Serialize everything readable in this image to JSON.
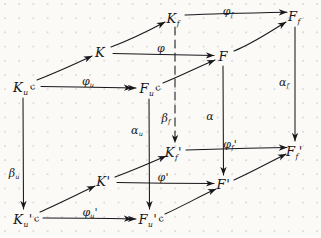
{
  "figure": {
    "kind": "commutative-diagram",
    "ink_color": "#17171c",
    "paper_color": "#fbfaf6",
    "grid_dot_color": "#969baa"
  },
  "nodes": [
    {
      "id": "Kf",
      "base": "K",
      "sub": "f",
      "prime": "",
      "hook": "",
      "x": 174,
      "y": 18
    },
    {
      "id": "Ff",
      "base": "F",
      "sub": "f",
      "prime": "",
      "hook": "",
      "x": 295,
      "y": 16
    },
    {
      "id": "K",
      "base": "K",
      "sub": "",
      "prime": "",
      "hook": "",
      "x": 101,
      "y": 52
    },
    {
      "id": "F",
      "base": "F",
      "sub": "",
      "prime": "",
      "hook": "",
      "x": 224,
      "y": 56
    },
    {
      "id": "Ku",
      "base": "K",
      "sub": "u",
      "prime": "",
      "hook": "c",
      "x": 24,
      "y": 87
    },
    {
      "id": "Fu",
      "base": "F",
      "sub": "u",
      "prime": "",
      "hook": "c",
      "x": 150,
      "y": 88
    },
    {
      "id": "Kfp",
      "base": "K",
      "sub": "f",
      "prime": "'",
      "hook": "",
      "x": 174,
      "y": 152
    },
    {
      "id": "Ffp",
      "base": "F",
      "sub": "f",
      "prime": "'",
      "hook": "",
      "x": 295,
      "y": 151
    },
    {
      "id": "Kp",
      "base": "K",
      "sub": "",
      "prime": "'",
      "hook": "",
      "x": 104,
      "y": 181
    },
    {
      "id": "Fp",
      "base": "F",
      "sub": "",
      "prime": "'",
      "hook": "",
      "x": 224,
      "y": 184
    },
    {
      "id": "Kup",
      "base": "K",
      "sub": "u",
      "prime": "'",
      "hook": "c",
      "x": 26,
      "y": 219
    },
    {
      "id": "Fup",
      "base": "F",
      "sub": "u",
      "prime": "'",
      "hook": "c",
      "x": 151,
      "y": 219
    }
  ],
  "arrow_labels": [
    {
      "id": "phi_f",
      "base": "φ",
      "sub": "f",
      "prime": "",
      "x": 228,
      "y": 10,
      "of": "Kf-to-Ff"
    },
    {
      "id": "phi",
      "base": "φ",
      "sub": "",
      "prime": "",
      "x": 161,
      "y": 47,
      "of": "K-to-F"
    },
    {
      "id": "phi_u",
      "base": "φ",
      "sub": "u",
      "prime": "",
      "x": 88,
      "y": 80,
      "of": "Ku-to-Fu"
    },
    {
      "id": "alpha_f",
      "base": "α",
      "sub": "f",
      "prime": "",
      "x": 284,
      "y": 81,
      "of": "Ff-to-Ffp"
    },
    {
      "id": "beta_f",
      "base": "β",
      "sub": "f",
      "prime": "",
      "x": 166,
      "y": 117,
      "of": "Kf-to-Kfp"
    },
    {
      "id": "alpha",
      "base": "α",
      "sub": "",
      "prime": "",
      "x": 210,
      "y": 115,
      "of": "F-to-Fp"
    },
    {
      "id": "alpha_u",
      "base": "α",
      "sub": "u",
      "prime": "",
      "x": 137,
      "y": 129,
      "of": "Fu-to-Fup"
    },
    {
      "id": "phi_f_p",
      "base": "φ",
      "sub": "f",
      "prime": "'",
      "x": 230,
      "y": 143,
      "of": "Kfp-to-Ffp"
    },
    {
      "id": "beta_u",
      "base": "β",
      "sub": "u",
      "prime": "",
      "x": 14,
      "y": 172,
      "of": "Ku-to-Kup"
    },
    {
      "id": "phi_p",
      "base": "φ",
      "sub": "",
      "prime": "'",
      "x": 163,
      "y": 176,
      "of": "Kp-to-Fp"
    },
    {
      "id": "phi_u_p",
      "base": "φ",
      "sub": "u",
      "prime": "'",
      "x": 90,
      "y": 211,
      "of": "Kup-to-Fup"
    }
  ],
  "edges": [
    {
      "id": "Kf-to-Ff",
      "style": "solid",
      "head": "single",
      "from": "Kf",
      "to": "Ff"
    },
    {
      "id": "K-to-F",
      "style": "solid",
      "head": "single",
      "from": "K",
      "to": "F"
    },
    {
      "id": "Ku-to-Fu",
      "style": "solid",
      "head": "double",
      "from": "Ku",
      "to": "Fu"
    },
    {
      "id": "Ku-to-K",
      "style": "solid",
      "head": "single",
      "from": "Ku",
      "to": "K"
    },
    {
      "id": "K-to-Kf",
      "style": "solid",
      "head": "single",
      "from": "K",
      "to": "Kf"
    },
    {
      "id": "Fu-to-F",
      "style": "solid",
      "head": "single",
      "from": "Fu",
      "to": "F"
    },
    {
      "id": "F-to-Ff",
      "style": "solid",
      "head": "single",
      "from": "F",
      "to": "Ff"
    },
    {
      "id": "Kf-to-Kfp",
      "style": "dashed",
      "head": "single",
      "from": "Kf",
      "to": "Kfp"
    },
    {
      "id": "F-to-Fp",
      "style": "solid",
      "head": "single",
      "from": "F",
      "to": "Fp"
    },
    {
      "id": "Ff-to-Ffp",
      "style": "solid",
      "head": "single",
      "from": "Ff",
      "to": "Ffp"
    },
    {
      "id": "Ku-to-Kup",
      "style": "solid",
      "head": "single",
      "from": "Ku",
      "to": "Kup"
    },
    {
      "id": "Fu-to-Fup",
      "style": "solid",
      "head": "single",
      "from": "Fu",
      "to": "Fup"
    },
    {
      "id": "Kfp-to-Ffp",
      "style": "solid",
      "head": "single",
      "from": "Kfp",
      "to": "Ffp"
    },
    {
      "id": "Kp-to-Fp",
      "style": "solid",
      "head": "single",
      "from": "Kp",
      "to": "Fp"
    },
    {
      "id": "Kup-to-Fup",
      "style": "solid",
      "head": "double",
      "from": "Kup",
      "to": "Fup"
    },
    {
      "id": "Kup-to-Kp",
      "style": "solid",
      "head": "single",
      "from": "Kup",
      "to": "Kp"
    },
    {
      "id": "Kp-to-Kfp",
      "style": "solid",
      "head": "single",
      "from": "Kp",
      "to": "Kfp"
    },
    {
      "id": "Fup-to-Fp",
      "style": "solid",
      "head": "single",
      "from": "Fup",
      "to": "Fp"
    },
    {
      "id": "Fp-to-Ffp",
      "style": "solid",
      "head": "single",
      "from": "Fp",
      "to": "Ffp"
    }
  ]
}
